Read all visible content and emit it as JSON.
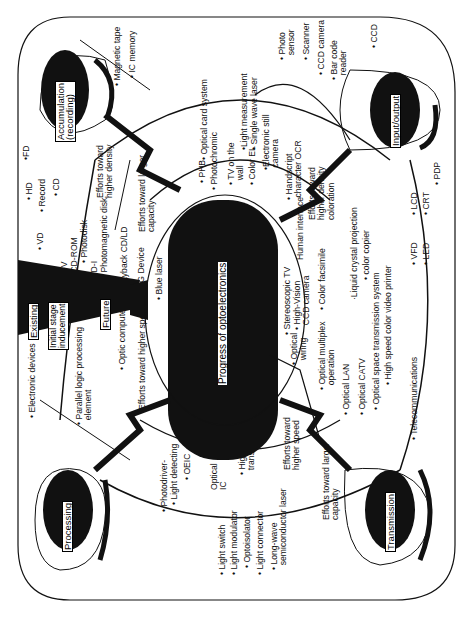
{
  "diagram": {
    "title": "Progress of optoelectronics",
    "orientation": "rotated 90 degrees counter-clockwise",
    "colors": {
      "ink": "#111111",
      "paper": "#ffffff"
    },
    "stages": [
      "Existing",
      "Initial stage\ninducement",
      "Future"
    ],
    "domains": {
      "accumulation": {
        "label": "Accumulation\n(recording)",
        "outer_items": [
          "• Magnetic tape",
          "• IC memory",
          "•FD",
          "• HD",
          "• Record",
          "• CD",
          "• VD"
        ],
        "efforts": [
          "Efforts toward\nhigher density",
          "Efforts toward larger\ncapacity"
        ],
        "inner_items": [
          "• CD-V",
          "• CD-ROM",
          "• Photodisk",
          "• CD-I",
          "• Photomagnetic disk",
          "• Playback CD/LD",
          "• SHG Device",
          "• Blue laser"
        ]
      },
      "input_output": {
        "label": "Input/output",
        "outer_items": [
          "• Photo\n  sensor",
          "• Scanner",
          "• CCD camera",
          "• Bar code\n  reader",
          "• CCD",
          "•Light measurement",
          "• Single wave laser",
          "•Electronic still\n camera",
          "• Handscript\n character OCR"
        ],
        "inner_items": [
          "• Optical card system",
          "• PHB",
          "• Photochromic",
          "• TV on the\n  wall",
          "• Color EL"
        ],
        "efforts": [
          "Human interface",
          "Efforts toward\nhigher density\ncoloration"
        ],
        "display_items": [
          "• VFD",
          "• LED",
          "• LCD",
          "• CRT",
          "• PDP",
          "·Liquid crystal projection",
          "• color copier",
          "• Color facsimile"
        ]
      },
      "processing": {
        "label": "Processing",
        "outer_items": [
          "• Electronic devices",
          "• Parallel logic processing\n  element"
        ],
        "inner_items": [
          "• Optic computer",
          "• OEIC",
          "Optical\nIC"
        ],
        "efforts": [
          "Efforts toward higher speed",
          "Efforts toward higher speed"
        ],
        "device_items": [
          "• Photodriver-",
          "• Light detecting",
          "• Light switch",
          "• Light modulator",
          "• Optoisolator",
          "• Light connector",
          "• Long-wave\n  semiconductor laser"
        ]
      },
      "transmission": {
        "label": "Transmission",
        "outer_items": [
          "• Telecommunications"
        ],
        "inner_items": [
          "• High vision\n  transmission system",
          "• Optical\n  wiring",
          "• Stereoscopic TV",
          "• High-Vision\n  CCD camera",
          "• Optical multiplex\n  operation",
          "• Optical LAN",
          "• Optical CATV",
          "• Optical space transmission system",
          "• High speed color video printer"
        ],
        "efforts": [
          "Efforts toward\nhigher speed",
          "Efforts toward larger\ncapacity"
        ]
      }
    }
  }
}
